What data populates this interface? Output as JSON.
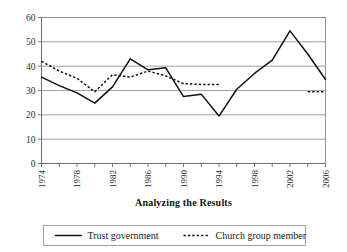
{
  "chart_data": {
    "type": "line",
    "title": "",
    "xlabel": "Analyzing the Results",
    "ylabel": "",
    "ylim": [
      0,
      60
    ],
    "ytick_values": [
      0,
      10,
      20,
      30,
      40,
      50,
      60
    ],
    "ytick_labels": [
      "0",
      "10",
      "20",
      "30",
      "40",
      "50",
      "60"
    ],
    "grid": true,
    "legend_position": "bottom",
    "x": [
      1974,
      1976,
      1978,
      1980,
      1982,
      1984,
      1986,
      1988,
      1990,
      1992,
      1994,
      1996,
      1998,
      2000,
      2002,
      2004,
      2006
    ],
    "xtick_labels": [
      "1974",
      "1978",
      "1982",
      "1986",
      "1990",
      "1994",
      "1998",
      "2002",
      "2006"
    ],
    "xtick_values": [
      1974,
      1978,
      1982,
      1986,
      1990,
      1994,
      1998,
      2002,
      2006
    ],
    "xtick_rotation": -90,
    "series": [
      {
        "name": "Trust government",
        "style": "solid",
        "color": "#111111",
        "x": [
          1974,
          1976,
          1978,
          1980,
          1982,
          1984,
          1986,
          1988,
          1990,
          1992,
          1994,
          1996,
          1998,
          2000,
          2002,
          2004,
          2006
        ],
        "values": [
          35.5,
          32.0,
          29.0,
          24.8,
          31.5,
          43.0,
          38.5,
          39.3,
          27.5,
          28.5,
          19.5,
          30.5,
          37.0,
          42.5,
          54.5,
          45.0,
          34.5
        ]
      },
      {
        "name": "Church group member",
        "style": "dotted",
        "color": "#111111",
        "x": [
          1974,
          1976,
          1978,
          1980,
          1982,
          1984,
          1986,
          1988,
          1990,
          1992,
          1994,
          2004,
          2006
        ],
        "values": [
          42.0,
          38.0,
          35.0,
          29.5,
          36.5,
          35.5,
          38.0,
          36.0,
          32.8,
          32.5,
          32.5,
          29.5,
          29.5
        ],
        "segments": [
          {
            "x": [
              1974,
              1976,
              1978,
              1980,
              1982,
              1984,
              1986,
              1988,
              1990,
              1992,
              1994
            ],
            "values": [
              42.0,
              38.0,
              35.0,
              29.5,
              36.5,
              35.5,
              38.0,
              36.0,
              32.8,
              32.5,
              32.5
            ]
          },
          {
            "x": [
              2004,
              2006
            ],
            "values": [
              29.5,
              29.5
            ]
          }
        ]
      }
    ]
  },
  "legend": {
    "items": [
      {
        "label": "Trust government",
        "style": "solid"
      },
      {
        "label": "Church group member",
        "style": "dotted"
      }
    ]
  },
  "axis": {
    "x_title": "Analyzing the Results"
  }
}
